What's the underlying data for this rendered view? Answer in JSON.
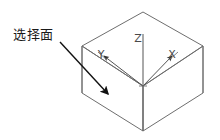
{
  "figure": {
    "type": "isometric-wireframe-box-with-axes",
    "background_color": "#ffffff",
    "line_color": "#6e6e6e",
    "axis_color": "#555555",
    "arrow_color": "#111111",
    "text_color": "#1a1a1a"
  },
  "annotation": {
    "label": "选择面",
    "leader": {
      "start": [
        60,
        42
      ],
      "end": [
        110,
        96
      ],
      "arrowhead": "solid-triangle"
    }
  },
  "axes": {
    "origin_label": "",
    "items": [
      {
        "name": "z-axis",
        "label": "Z",
        "label_pos": [
          138,
          42
        ],
        "direction": "up"
      },
      {
        "name": "y-axis",
        "label": "Y",
        "label_pos": [
          101,
          58
        ],
        "direction": "left-up"
      },
      {
        "name": "x-axis",
        "label": "X",
        "label_pos": [
          172,
          58
        ],
        "direction": "right-up"
      }
    ],
    "markers": [
      {
        "name": "y-axis-arrow-marker",
        "pos": [
          113,
          63
        ]
      },
      {
        "name": "x-axis-arrow-marker",
        "pos": [
          162,
          63
        ]
      },
      {
        "name": "origin-marker",
        "pos": [
          143,
          86
        ]
      }
    ]
  },
  "box": {
    "name": "isometric-box",
    "vertices": {
      "top_back": [
        143,
        12
      ],
      "top_left": [
        82,
        46
      ],
      "top_right": [
        203,
        46
      ],
      "top_front": [
        143,
        86
      ],
      "bottom_left": [
        82,
        93
      ],
      "bottom_right": [
        203,
        93
      ],
      "bottom_front": [
        143,
        131
      ]
    },
    "selected_face": "left-front-face"
  }
}
